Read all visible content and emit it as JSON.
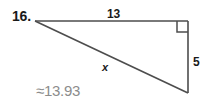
{
  "problem": {
    "number_label": "16.",
    "answer_label": "≈13.93"
  },
  "figure": {
    "type": "right-triangle",
    "labels": {
      "top_leg": "13",
      "right_leg": "5",
      "hypotenuse": "x"
    },
    "right_angle_marker": "right-angle-square",
    "colors": {
      "stroke": "#4d4d4d",
      "text": "#1a1a1a",
      "answer_text": "#8c8c8c",
      "background": "#ffffff"
    },
    "vertices": {
      "left": [
        35,
        21
      ],
      "top_right": [
        188,
        21
      ],
      "bottom_right": [
        188,
        93
      ]
    }
  }
}
